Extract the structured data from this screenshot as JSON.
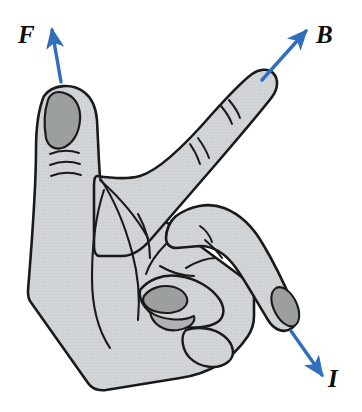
{
  "figure": {
    "kind": "right-hand-rule-diagram",
    "background_color": "#ffffff"
  },
  "palette": {
    "skin_fill": "#d3d7da",
    "skin_fill_shadow": "#c7cbce",
    "nail_fill": "#9b9fa0",
    "outline": "#1a1a1a",
    "arrow_blue": "#2f6fbd",
    "label_color": "#0d0d0d"
  },
  "vectors": [
    {
      "id": "force",
      "label": "F",
      "meaning": "force",
      "color": "#2f6fbd",
      "direction": "up",
      "tail": [
        61,
        82
      ],
      "head": [
        52,
        26
      ],
      "label_position": [
        18,
        22
      ]
    },
    {
      "id": "field",
      "label": "B",
      "meaning": "magnetic-field",
      "color": "#2f6fbd",
      "direction": "up-right",
      "tail": [
        262,
        80
      ],
      "head": [
        308,
        28
      ],
      "label_position": [
        316,
        22
      ]
    },
    {
      "id": "current",
      "label": "I",
      "meaning": "current",
      "color": "#2f6fbd",
      "direction": "down-right",
      "tail": [
        291,
        330
      ],
      "head": [
        324,
        378
      ],
      "label_position": [
        328,
        366
      ]
    }
  ],
  "hand": {
    "side": "right",
    "pose": "thumb-up, index-finger-up-right, middle-finger-down-right",
    "parts": [
      {
        "name": "palm",
        "fill": "#d3d7da"
      },
      {
        "name": "thumb",
        "fill": "#d3d7da",
        "nail": "#9b9fa0"
      },
      {
        "name": "index-finger",
        "fill": "#d3d7da"
      },
      {
        "name": "middle-finger",
        "fill": "#d3d7da",
        "nail": "#9b9fa0"
      },
      {
        "name": "folded-ring-finger",
        "fill": "#d3d7da",
        "nail": "#9b9fa0"
      },
      {
        "name": "folded-little-finger",
        "fill": "#d3d7da"
      }
    ]
  }
}
